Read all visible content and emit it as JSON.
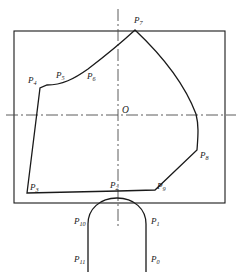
{
  "figure": {
    "type": "technical-geometry-drawing",
    "background_color": "#ffffff",
    "stroke_color": "#1a1a1a",
    "centerline_color": "#4a4a4a",
    "canvas": {
      "width": 239,
      "height": 276
    },
    "center_label": "O",
    "center_point": {
      "x": 118,
      "y": 115
    },
    "bounding_rectangle": {
      "name": "outer-rectangle",
      "x": 14,
      "y": 31,
      "width": 211,
      "height": 172,
      "stroke_width": 1.1
    },
    "centerlines": {
      "horizontal": {
        "x1": 6,
        "y1": 115,
        "x2": 236,
        "y2": 115
      },
      "vertical": {
        "x1": 118,
        "y1": 9,
        "x2": 118,
        "y2": 226
      },
      "dash_pattern": "12 3 2 3",
      "stroke_width": 0.9
    },
    "profile_outline": {
      "name": "closed-profile",
      "stroke_width": 1.3,
      "path": "M 27 193 L 40 88 L 47 85 C 62 85 74 79 88 69 C 105 56 122 42 135 30 C 152 46 182 77 196 114 C 199 126 198 136 197 150 L 155 190 L 118 191 Z"
    },
    "notch_arch": {
      "name": "bottom-arch-notch",
      "stroke_width": 1.3,
      "path": "M 88 272 L 88 224 C 88 209 100 198 117 198 C 134 198 146 209 146 224 L 146 272"
    },
    "points": [
      {
        "id": "P0",
        "label_base": "P",
        "label_sub": "0",
        "x": 146,
        "y": 272,
        "label_x": 151,
        "label_y": 262,
        "kind": "arch-endpoint-right"
      },
      {
        "id": "P1",
        "label_base": "P",
        "label_sub": "1",
        "x": 146,
        "y": 228,
        "label_x": 151,
        "label_y": 224,
        "kind": "arch-tangent-right"
      },
      {
        "id": "P2",
        "label_base": "P",
        "label_sub": "2",
        "x": 118,
        "y": 191,
        "label_x": 110,
        "label_y": 188,
        "kind": "profile-vertex-bottom-center"
      },
      {
        "id": "P3",
        "label_base": "P",
        "label_sub": "3",
        "x": 27,
        "y": 193,
        "label_x": 30,
        "label_y": 190,
        "kind": "profile-vertex-bottom-left"
      },
      {
        "id": "P4",
        "label_base": "P",
        "label_sub": "4",
        "x": 40,
        "y": 88,
        "label_x": 28,
        "label_y": 83,
        "kind": "profile-vertex-left"
      },
      {
        "id": "P5",
        "label_base": "P",
        "label_sub": "5",
        "x": 62,
        "y": 84,
        "label_x": 56,
        "label_y": 78,
        "kind": "curve-control-upper-left"
      },
      {
        "id": "P6",
        "label_base": "P",
        "label_sub": "6",
        "x": 92,
        "y": 72,
        "label_x": 87,
        "label_y": 79,
        "kind": "curve-control-upper-mid"
      },
      {
        "id": "P7",
        "label_base": "P",
        "label_sub": "7",
        "x": 135,
        "y": 30,
        "label_x": 134,
        "label_y": 23,
        "kind": "profile-apex-top"
      },
      {
        "id": "P8",
        "label_base": "P",
        "label_sub": "8",
        "x": 197,
        "y": 150,
        "label_x": 200,
        "label_y": 158,
        "kind": "profile-vertex-right"
      },
      {
        "id": "P9",
        "label_base": "P",
        "label_sub": "9",
        "x": 155,
        "y": 190,
        "label_x": 157,
        "label_y": 189,
        "kind": "profile-vertex-bottom-right"
      },
      {
        "id": "P10",
        "label_base": "P",
        "label_sub": "10",
        "x": 88,
        "y": 228,
        "label_x": 74,
        "label_y": 224,
        "kind": "arch-tangent-left"
      },
      {
        "id": "P11",
        "label_base": "P",
        "label_sub": "11",
        "x": 88,
        "y": 272,
        "label_x": 74,
        "label_y": 262,
        "kind": "arch-endpoint-left"
      }
    ]
  }
}
